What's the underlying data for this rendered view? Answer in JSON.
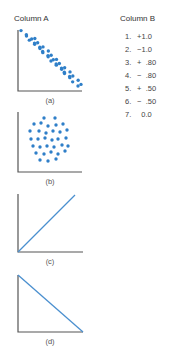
{
  "column_a": {
    "heading": "Column A"
  },
  "column_b": {
    "heading": "Column B",
    "items": [
      {
        "number": "1.",
        "value": "+1.0"
      },
      {
        "number": "2.",
        "value": "−1.0"
      },
      {
        "number": "3.",
        "value": "+  .80"
      },
      {
        "number": "4.",
        "value": "−  .80"
      },
      {
        "number": "5.",
        "value": "+  .50"
      },
      {
        "number": "6.",
        "value": "−  .50"
      },
      {
        "number": "7.",
        "value": "  0.0"
      }
    ]
  },
  "colors": {
    "dot": "#2f7fc8",
    "line": "#4a8fcf",
    "axis": "#555555"
  },
  "plots": [
    {
      "id": "a",
      "label": "(a)",
      "type": "scatter-negative"
    },
    {
      "id": "b",
      "label": "(b)",
      "type": "scatter-none"
    },
    {
      "id": "c",
      "label": "(c)",
      "type": "line-positive"
    },
    {
      "id": "d",
      "label": "(d)",
      "type": "line-negative"
    }
  ]
}
